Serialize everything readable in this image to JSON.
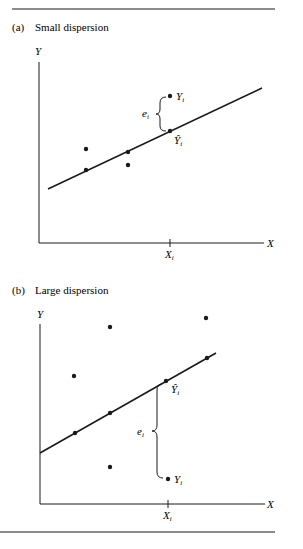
{
  "panels": [
    {
      "id": "a",
      "tag": "(a)",
      "title": "Small dispersion",
      "axis_y_label": "Y",
      "axis_x_label": "X",
      "tick_label": "X",
      "tick_sub": "i",
      "residual_label": "e",
      "residual_sub": "i",
      "observed_label": "Y",
      "observed_sub": "i",
      "fitted_label": "Ŷ",
      "fitted_sub": "i"
    },
    {
      "id": "b",
      "tag": "(b)",
      "title": "Large dispersion",
      "axis_y_label": "Y",
      "axis_x_label": "X",
      "tick_label": "X",
      "tick_sub": "i",
      "residual_label": "e",
      "residual_sub": "i",
      "observed_label": "Y",
      "observed_sub": "i",
      "fitted_label": "Ŷ",
      "fitted_sub": "i"
    }
  ],
  "colors": {
    "ink": "#1a1a1a",
    "background": "#ffffff"
  }
}
